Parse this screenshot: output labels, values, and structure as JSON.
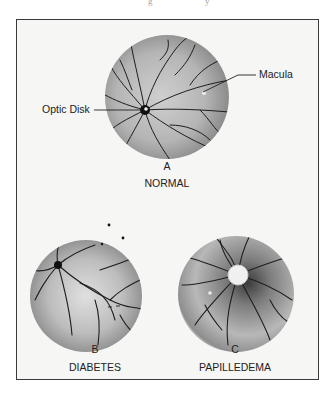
{
  "figure": {
    "panels": [
      {
        "letter": "A",
        "caption": "NORMAL"
      },
      {
        "letter": "B",
        "caption": "DIABETES"
      },
      {
        "letter": "C",
        "caption": "PAPILLEDEMA"
      }
    ],
    "annotations": {
      "optic_disk": "Optic Disk",
      "macula": "Macula"
    }
  },
  "colors": {
    "frame_border": "#3a3a3a",
    "frame_bg": "#f6f6f5",
    "vessel": "#1e1e1e",
    "fundus_light": "#d9d9d9",
    "fundus_dark": "#7a7a7a"
  }
}
